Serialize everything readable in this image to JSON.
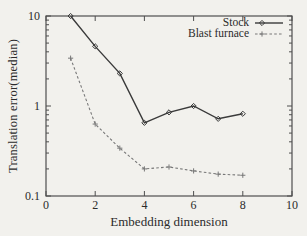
{
  "chart_data": {
    "type": "line",
    "title": "",
    "xlabel": "Embedding dimension",
    "ylabel": "Translation error(median)",
    "x_scale": "linear",
    "y_scale": "log",
    "xlim": [
      0,
      10
    ],
    "ylim": [
      0.1,
      10
    ],
    "x_ticks": [
      0,
      2,
      4,
      6,
      8,
      10
    ],
    "x_tick_labels": [
      "0",
      "2",
      "4",
      "6",
      "8",
      "10"
    ],
    "y_ticks": [
      0.1,
      1,
      10
    ],
    "y_tick_labels": [
      "0.1",
      "1",
      "10"
    ],
    "grid": false,
    "legend_position": "top-right-inside",
    "x": [
      1,
      2,
      3,
      4,
      5,
      6,
      7,
      8
    ],
    "series": [
      {
        "name": "Stock",
        "values": [
          10,
          4.6,
          2.3,
          0.65,
          0.85,
          1.0,
          0.72,
          0.82
        ],
        "line": "solid",
        "marker": "diamond",
        "color": "#3a3a3a"
      },
      {
        "name": "Blast furnace",
        "values": [
          3.4,
          0.63,
          0.34,
          0.2,
          0.21,
          0.19,
          0.175,
          0.17
        ],
        "line": "dashed",
        "marker": "plus",
        "color": "#787878"
      }
    ]
  },
  "colors": {
    "background": "#f2f1ed",
    "axis": "#4f4f4f",
    "text": "#2b2b2b"
  }
}
